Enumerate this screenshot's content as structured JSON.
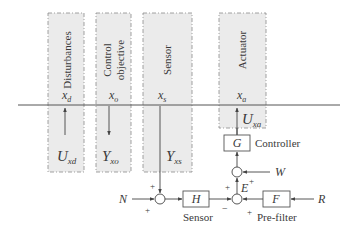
{
  "diagram": {
    "colors": {
      "panel_fill": "#ebebeb",
      "panel_border": "#8a8a8a",
      "line": "#555555",
      "text": "#3a3a3a"
    },
    "panels": [
      {
        "id": "disturbances",
        "title_line1": "Disturbances",
        "title_line2": "",
        "top_var": "x",
        "top_sub": "d",
        "bottom_var": "U",
        "bottom_sub": "xd",
        "arrow": "up"
      },
      {
        "id": "control-objective",
        "title_line1": "Control",
        "title_line2": "objective",
        "top_var": "x",
        "top_sub": "o",
        "bottom_var": "Y",
        "bottom_sub": "xo",
        "arrow": "down"
      },
      {
        "id": "sensor",
        "title_line1": "Sensor",
        "title_line2": "",
        "top_var": "x",
        "top_sub": "s",
        "bottom_var": "Y",
        "bottom_sub": "xs",
        "arrow": "down-through"
      },
      {
        "id": "actuator",
        "title_line1": "Actuator",
        "title_line2": "",
        "top_var": "x",
        "top_sub": "a",
        "bottom_var": "U",
        "bottom_sub": "xa",
        "arrow": "up"
      }
    ],
    "blocks": {
      "controller": {
        "symbol": "G",
        "label": "Controller"
      },
      "sensor": {
        "symbol": "H",
        "label": "Sensor"
      },
      "prefilter": {
        "symbol": "F",
        "label": "Pre-filter"
      }
    },
    "signals": {
      "noise": "N",
      "reference": "R",
      "error": "E",
      "disturbance_input": "W"
    },
    "signs": {
      "noise_sum_top": "+",
      "noise_sum_bottom": "+",
      "error_sum_left_top": "+",
      "error_sum_sensor": "−",
      "error_sum_prefilter": "+",
      "w_sum": "+"
    }
  }
}
